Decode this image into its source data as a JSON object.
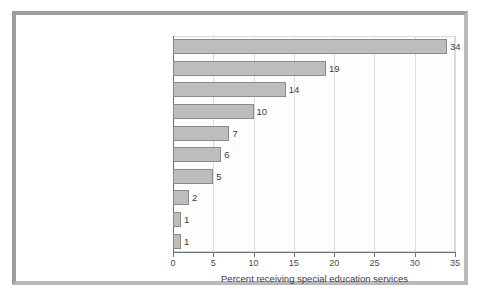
{
  "chart_data": {
    "type": "bar",
    "orientation": "horizontal",
    "title": "",
    "xlabel": "Percent receiving special education services",
    "ylabel": "",
    "xlim": [
      0,
      35
    ],
    "xticks": [
      0,
      5,
      10,
      15,
      20,
      25,
      30,
      35
    ],
    "xtick_labels": [
      "0",
      "5",
      "10",
      "15",
      "20",
      "25",
      "30",
      "35"
    ],
    "grid": true,
    "legend": false,
    "categories": [
      "Specific learning disability",
      "Speech or language impairment",
      "Other health impairment",
      "Autism spectrum disorder",
      "Developmental delay",
      "Intellectual disability",
      "Emotional disturbance",
      "Multiple disabilities",
      "Hearing impairment",
      "Orthopedic impairment"
    ],
    "values": [
      34,
      19,
      14,
      10,
      7,
      6,
      5,
      2,
      1,
      1
    ],
    "data_labels": [
      "34",
      "19",
      "14",
      "10",
      "7",
      "6",
      "5",
      "2",
      "1",
      "1"
    ],
    "bar_fill_color": "#bdbdbd",
    "bar_edge_color": "#8a8a8a",
    "grid_color": "#dcdcdc",
    "axis_color": "#6f6f6f"
  }
}
